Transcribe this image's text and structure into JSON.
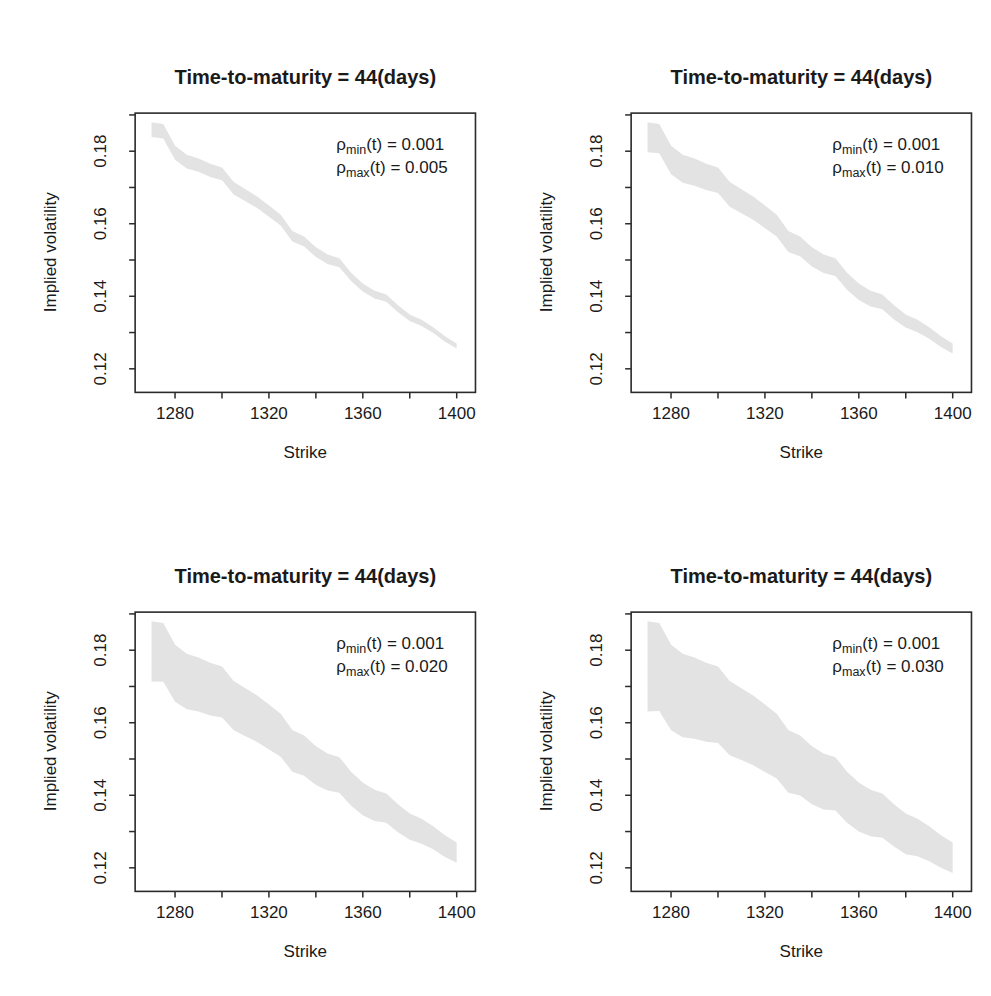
{
  "figure": {
    "background": "#ffffff",
    "colors": {
      "band": "#e3e3e3",
      "axis": "#2b2b2b",
      "text": "#1a1a1a"
    }
  },
  "chart_data": [
    {
      "id": "top-left",
      "type": "area",
      "title": "Time-to-maturity = 44(days)",
      "xlabel": "Strike",
      "ylabel": "Implied volatility",
      "xlim": [
        1263,
        1408
      ],
      "ylim": [
        0.1135,
        0.1905
      ],
      "x_ticks": [
        1280,
        1300,
        1320,
        1340,
        1360,
        1380,
        1400
      ],
      "x_tick_labels": [
        "1280",
        "",
        "1320",
        "",
        "1360",
        "",
        "1400"
      ],
      "y_ticks": [
        0.12,
        0.13,
        0.14,
        0.15,
        0.16,
        0.17,
        0.18,
        0.19
      ],
      "y_tick_labels": [
        "0.12",
        "",
        "0.14",
        "",
        "0.16",
        "",
        "0.18",
        ""
      ],
      "grid": false,
      "legend_position": "top-right-inside",
      "annotations": [
        {
          "sym": "ρ",
          "sub": "min",
          "rest": "(t) = 0.001"
        },
        {
          "sym": "ρ",
          "sub": "max",
          "rest": "(t) = 0.005"
        }
      ],
      "band": {
        "x": [
          1270,
          1275,
          1280,
          1285,
          1290,
          1295,
          1300,
          1305,
          1310,
          1315,
          1320,
          1325,
          1330,
          1335,
          1340,
          1345,
          1350,
          1355,
          1360,
          1365,
          1370,
          1375,
          1380,
          1385,
          1390,
          1395,
          1400
        ],
        "upper": [
          0.188,
          0.1875,
          0.1815,
          0.179,
          0.178,
          0.1765,
          0.1755,
          0.1715,
          0.1695,
          0.1675,
          0.165,
          0.1625,
          0.158,
          0.1565,
          0.1535,
          0.1515,
          0.1505,
          0.1465,
          0.1435,
          0.1415,
          0.1405,
          0.1375,
          0.135,
          0.1335,
          0.1315,
          0.129,
          0.127
        ],
        "lower": [
          0.1839,
          0.1835,
          0.1776,
          0.1752,
          0.1743,
          0.1729,
          0.172,
          0.1681,
          0.1662,
          0.1643,
          0.1619,
          0.1595,
          0.1551,
          0.1537,
          0.1508,
          0.1489,
          0.148,
          0.1442,
          0.1413,
          0.1394,
          0.1385,
          0.1356,
          0.1332,
          0.1318,
          0.1299,
          0.1275,
          0.1256
        ]
      }
    },
    {
      "id": "top-right",
      "type": "area",
      "title": "Time-to-maturity = 44(days)",
      "xlabel": "Strike",
      "ylabel": "Implied volatility",
      "xlim": [
        1263,
        1408
      ],
      "ylim": [
        0.1135,
        0.1905
      ],
      "x_ticks": [
        1280,
        1300,
        1320,
        1340,
        1360,
        1380,
        1400
      ],
      "x_tick_labels": [
        "1280",
        "",
        "1320",
        "",
        "1360",
        "",
        "1400"
      ],
      "y_ticks": [
        0.12,
        0.13,
        0.14,
        0.15,
        0.16,
        0.17,
        0.18,
        0.19
      ],
      "y_tick_labels": [
        "0.12",
        "",
        "0.14",
        "",
        "0.16",
        "",
        "0.18",
        ""
      ],
      "grid": false,
      "legend_position": "top-right-inside",
      "annotations": [
        {
          "sym": "ρ",
          "sub": "min",
          "rest": "(t) = 0.001"
        },
        {
          "sym": "ρ",
          "sub": "max",
          "rest": "(t) = 0.010"
        }
      ],
      "band": {
        "x": [
          1270,
          1275,
          1280,
          1285,
          1290,
          1295,
          1300,
          1305,
          1310,
          1315,
          1320,
          1325,
          1330,
          1335,
          1340,
          1345,
          1350,
          1355,
          1360,
          1365,
          1370,
          1375,
          1380,
          1385,
          1390,
          1395,
          1400
        ],
        "upper": [
          0.188,
          0.1875,
          0.1815,
          0.179,
          0.178,
          0.1765,
          0.1755,
          0.1715,
          0.1695,
          0.1675,
          0.165,
          0.1625,
          0.158,
          0.1565,
          0.1535,
          0.1515,
          0.1505,
          0.1465,
          0.1435,
          0.1415,
          0.1405,
          0.1375,
          0.135,
          0.1335,
          0.1315,
          0.129,
          0.127
        ],
        "lower": [
          0.1797,
          0.1794,
          0.1736,
          0.1713,
          0.1705,
          0.1693,
          0.1685,
          0.1647,
          0.1629,
          0.1611,
          0.1588,
          0.1565,
          0.1522,
          0.151,
          0.1482,
          0.1464,
          0.1456,
          0.1418,
          0.139,
          0.1372,
          0.1364,
          0.1336,
          0.1314,
          0.1301,
          0.1283,
          0.126,
          0.1242
        ]
      }
    },
    {
      "id": "bottom-left",
      "type": "area",
      "title": "Time-to-maturity = 44(days)",
      "xlabel": "Strike",
      "ylabel": "Implied volatility",
      "xlim": [
        1263,
        1408
      ],
      "ylim": [
        0.1135,
        0.1905
      ],
      "x_ticks": [
        1280,
        1300,
        1320,
        1340,
        1360,
        1380,
        1400
      ],
      "x_tick_labels": [
        "1280",
        "",
        "1320",
        "",
        "1360",
        "",
        "1400"
      ],
      "y_ticks": [
        0.12,
        0.13,
        0.14,
        0.15,
        0.16,
        0.17,
        0.18,
        0.19
      ],
      "y_tick_labels": [
        "0.12",
        "",
        "0.14",
        "",
        "0.16",
        "",
        "0.18",
        ""
      ],
      "grid": false,
      "legend_position": "top-right-inside",
      "annotations": [
        {
          "sym": "ρ",
          "sub": "min",
          "rest": "(t) = 0.001"
        },
        {
          "sym": "ρ",
          "sub": "max",
          "rest": "(t) = 0.020"
        }
      ],
      "band": {
        "x": [
          1270,
          1275,
          1280,
          1285,
          1290,
          1295,
          1300,
          1305,
          1310,
          1315,
          1320,
          1325,
          1330,
          1335,
          1340,
          1345,
          1350,
          1355,
          1360,
          1365,
          1370,
          1375,
          1380,
          1385,
          1390,
          1395,
          1400
        ],
        "upper": [
          0.188,
          0.1875,
          0.1815,
          0.179,
          0.178,
          0.1765,
          0.1755,
          0.1715,
          0.1695,
          0.1675,
          0.165,
          0.1625,
          0.158,
          0.1565,
          0.1535,
          0.1515,
          0.1505,
          0.1465,
          0.1435,
          0.1415,
          0.1405,
          0.1375,
          0.135,
          0.1335,
          0.1315,
          0.129,
          0.127
        ],
        "lower": [
          0.1714,
          0.1713,
          0.1658,
          0.1637,
          0.1631,
          0.162,
          0.1614,
          0.1579,
          0.1563,
          0.1547,
          0.1526,
          0.1506,
          0.1465,
          0.1454,
          0.1428,
          0.1413,
          0.1407,
          0.1371,
          0.1345,
          0.1329,
          0.1324,
          0.1298,
          0.1277,
          0.1266,
          0.1251,
          0.123,
          0.1214
        ]
      }
    },
    {
      "id": "bottom-right",
      "type": "area",
      "title": "Time-to-maturity = 44(days)",
      "xlabel": "Strike",
      "ylabel": "Implied volatility",
      "xlim": [
        1263,
        1408
      ],
      "ylim": [
        0.1135,
        0.1905
      ],
      "x_ticks": [
        1280,
        1300,
        1320,
        1340,
        1360,
        1380,
        1400
      ],
      "x_tick_labels": [
        "1280",
        "",
        "1320",
        "",
        "1360",
        "",
        "1400"
      ],
      "y_ticks": [
        0.12,
        0.13,
        0.14,
        0.15,
        0.16,
        0.17,
        0.18,
        0.19
      ],
      "y_tick_labels": [
        "0.12",
        "",
        "0.14",
        "",
        "0.16",
        "",
        "0.18",
        ""
      ],
      "grid": false,
      "legend_position": "top-right-inside",
      "annotations": [
        {
          "sym": "ρ",
          "sub": "min",
          "rest": "(t) = 0.001"
        },
        {
          "sym": "ρ",
          "sub": "max",
          "rest": "(t) = 0.030"
        }
      ],
      "band": {
        "x": [
          1270,
          1275,
          1280,
          1285,
          1290,
          1295,
          1300,
          1305,
          1310,
          1315,
          1320,
          1325,
          1330,
          1335,
          1340,
          1345,
          1350,
          1355,
          1360,
          1365,
          1370,
          1375,
          1380,
          1385,
          1390,
          1395,
          1400
        ],
        "upper": [
          0.188,
          0.1875,
          0.1815,
          0.179,
          0.178,
          0.1765,
          0.1755,
          0.1715,
          0.1695,
          0.1675,
          0.165,
          0.1625,
          0.158,
          0.1565,
          0.1535,
          0.1515,
          0.1505,
          0.1465,
          0.1435,
          0.1415,
          0.1405,
          0.1375,
          0.135,
          0.1335,
          0.1315,
          0.129,
          0.127
        ],
        "lower": [
          0.1631,
          0.1632,
          0.1579,
          0.156,
          0.1556,
          0.1548,
          0.1544,
          0.151,
          0.1497,
          0.1483,
          0.1464,
          0.1446,
          0.1407,
          0.1399,
          0.1375,
          0.1361,
          0.1358,
          0.1324,
          0.13,
          0.1287,
          0.1283,
          0.1259,
          0.1237,
          0.1232,
          0.1218,
          0.12,
          0.1186
        ]
      }
    }
  ]
}
